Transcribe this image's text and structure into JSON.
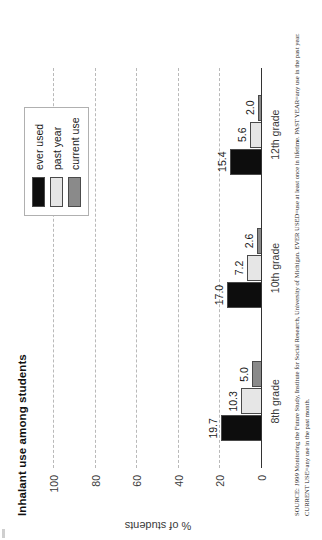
{
  "chart_data": {
    "type": "bar",
    "title": "Inhalant use among students",
    "xlabel": "",
    "ylabel": "% of students",
    "ylim": [
      0,
      100
    ],
    "yticks": [
      0,
      20,
      40,
      60,
      80,
      100
    ],
    "ytick_labels": [
      "0",
      "20",
      "40",
      "60",
      "80",
      "100"
    ],
    "grid": true,
    "legend_position": "top-right",
    "categories": [
      "8th grade",
      "10th grade",
      "12th grade"
    ],
    "series": [
      {
        "name": "ever used",
        "color": "#0d0d0d",
        "values": [
          19.7,
          17.0,
          15.4
        ],
        "labels": [
          "19.7",
          "17.0",
          "15.4"
        ]
      },
      {
        "name": "past year",
        "color": "#e6e6e6",
        "values": [
          10.3,
          7.2,
          5.6
        ],
        "labels": [
          "10.3",
          "7.2",
          "5.6"
        ]
      },
      {
        "name": "current use",
        "color": "#8a8a8a",
        "values": [
          5.0,
          2.6,
          2.0
        ],
        "labels": [
          "5.0",
          "2.6",
          "2.0"
        ]
      }
    ]
  },
  "source_note": {
    "label": "SOURCE:",
    "year": "1999",
    "text": "Monitoring the Future Study, Institute for Social Research, University of Michigan. EVER USED=use at least once in lifetime. PAST YEAR=any use in the past year. CURRENT USE=any use in the past month."
  }
}
